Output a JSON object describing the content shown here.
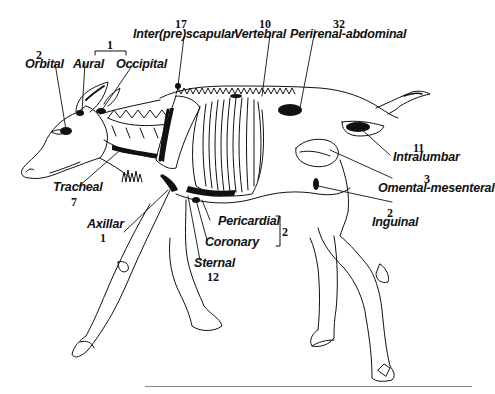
{
  "figure": {
    "ink_color": "#111111",
    "background": "#ffffff"
  },
  "labels": {
    "orbital": {
      "name": "Orbital",
      "count": "2"
    },
    "aural": {
      "name": "Aural"
    },
    "occipital": {
      "name": "Occipital"
    },
    "aural_occipital_group": {
      "count": "1"
    },
    "interprescapular": {
      "name": "Inter(pre)scapular",
      "count": "17"
    },
    "vertebral": {
      "name": "Vertebral",
      "count": "10"
    },
    "perirenal_abdominal": {
      "name": "Perirenal-abdominal",
      "count": "32"
    },
    "intralumbar": {
      "name": "Intralumbar",
      "count": "11"
    },
    "omental_mesenteral": {
      "name": "Omental-mesenteral",
      "count": "3"
    },
    "inguinal": {
      "name": "Inguinal",
      "count": "2"
    },
    "tracheal": {
      "name": "Tracheal",
      "count": "7"
    },
    "axillar": {
      "name": "Axillar",
      "count": "1"
    },
    "pericardial": {
      "name": "Pericardial"
    },
    "coronary": {
      "name": "Coronary"
    },
    "pericardial_coronary_group": {
      "count": "2"
    },
    "sternal": {
      "name": "Sternal",
      "count": "12"
    }
  }
}
